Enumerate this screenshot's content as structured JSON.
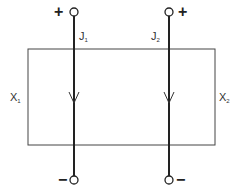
{
  "diagram": {
    "type": "two-port network",
    "box": {
      "label_left": "X",
      "label_left_sub": "1",
      "label_right": "X",
      "label_right_sub": "2"
    },
    "ports": [
      {
        "current_label": "J",
        "current_sub": "1",
        "top_sign": "+",
        "bottom_sign": "−",
        "direction": "down"
      },
      {
        "current_label": "J",
        "current_sub": "2",
        "top_sign": "+",
        "bottom_sign": "−",
        "direction": "down"
      }
    ]
  }
}
